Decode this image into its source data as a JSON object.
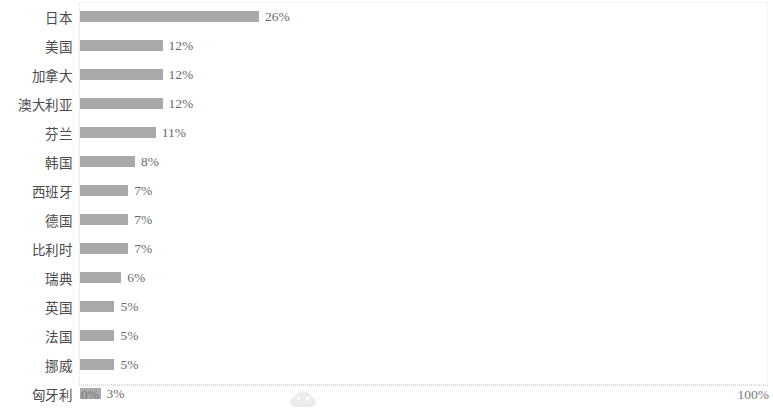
{
  "chart_data": {
    "type": "bar",
    "orientation": "horizontal",
    "title": "",
    "xlabel": "",
    "ylabel": "",
    "xlim": [
      0,
      100
    ],
    "grid": false,
    "legend": null,
    "categories": [
      "日本",
      "美国",
      "加拿大",
      "澳大利亚",
      "芬兰",
      "韩国",
      "西班牙",
      "德国",
      "比利时",
      "瑞典",
      "英国",
      "法国",
      "挪威",
      "匈牙利"
    ],
    "values": [
      26,
      12,
      12,
      12,
      11,
      8,
      7,
      7,
      7,
      6,
      5,
      5,
      5,
      3
    ],
    "value_labels": [
      "26%",
      "12%",
      "12%",
      "12%",
      "11%",
      "8%",
      "7%",
      "7%",
      "7%",
      "6%",
      "5%",
      "5%",
      "5%",
      "3%"
    ],
    "bars": [
      {
        "category": "日本",
        "value": 26,
        "label": "26%"
      },
      {
        "category": "美国",
        "value": 12,
        "label": "12%"
      },
      {
        "category": "加拿大",
        "value": 12,
        "label": "12%"
      },
      {
        "category": "澳大利亚",
        "value": 12,
        "label": "12%"
      },
      {
        "category": "芬兰",
        "value": 11,
        "label": "11%"
      },
      {
        "category": "韩国",
        "value": 8,
        "label": "8%"
      },
      {
        "category": "西班牙",
        "value": 7,
        "label": "7%"
      },
      {
        "category": "德国",
        "value": 7,
        "label": "7%"
      },
      {
        "category": "比利时",
        "value": 7,
        "label": "7%"
      },
      {
        "category": "瑞典",
        "value": 6,
        "label": "6%"
      },
      {
        "category": "英国",
        "value": 5,
        "label": "5%"
      },
      {
        "category": "法国",
        "value": 5,
        "label": "5%"
      },
      {
        "category": "挪威",
        "value": 5,
        "label": "5%"
      },
      {
        "category": "匈牙利",
        "value": 3,
        "label": "3%"
      }
    ],
    "axis": {
      "min_tick_label": "0%",
      "max_tick_label": "100%"
    },
    "colors": {
      "bar": "#a9a9a9",
      "category_text": "#4b4b4b",
      "value_text": "#6a6a6a",
      "axis_text": "#7a7a7a",
      "axis_line": "#d8d8d8",
      "background": "#ffffff"
    }
  },
  "watermark": {
    "icon": "watermark-logo-icon"
  }
}
